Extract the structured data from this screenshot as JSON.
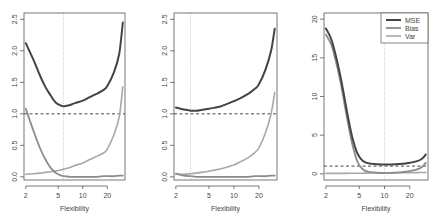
{
  "figure": {
    "width": 437,
    "height": 221,
    "colors": {
      "mse": "#444444",
      "bias": "#8c8c8c",
      "var": "#a8a8a8",
      "axis": "#555555",
      "ref": "#333333",
      "vline": "#bbbbbb"
    }
  },
  "chart_data": [
    {
      "type": "line",
      "title": "",
      "xlabel": "Flexibility",
      "ylabel": "",
      "xscale": "log",
      "xlim": [
        1.9,
        33
      ],
      "ylim": [
        -0.05,
        2.6
      ],
      "x_ticks": [
        2,
        5,
        10,
        20
      ],
      "x_tick_labels": [
        "2",
        "5",
        "10",
        "20"
      ],
      "y_ticks": [
        0.0,
        0.5,
        1.0,
        1.5,
        2.0,
        2.5
      ],
      "y_tick_labels": [
        "0.0",
        "0.5",
        "1.0",
        "1.5",
        "2.0",
        "2.5"
      ],
      "hline": {
        "y": 1.0,
        "style": "dashed"
      },
      "vline": {
        "x": 5.8,
        "style": "dotted"
      },
      "grid": false,
      "legend": null,
      "x": [
        2,
        2.5,
        3,
        3.5,
        4,
        4.5,
        5,
        5.8,
        7,
        8,
        10,
        12,
        15,
        18,
        20,
        24,
        28,
        31
      ],
      "series": [
        {
          "name": "MSE",
          "values": [
            2.12,
            1.85,
            1.6,
            1.42,
            1.3,
            1.2,
            1.15,
            1.12,
            1.14,
            1.17,
            1.21,
            1.26,
            1.32,
            1.38,
            1.44,
            1.65,
            1.95,
            2.45
          ]
        },
        {
          "name": "Bias",
          "values": [
            1.08,
            0.72,
            0.45,
            0.27,
            0.15,
            0.08,
            0.04,
            0.01,
            0.0,
            0.0,
            0.0,
            0.0,
            0.0,
            0.01,
            0.01,
            0.01,
            0.02,
            0.02
          ]
        },
        {
          "name": "Var",
          "values": [
            0.04,
            0.05,
            0.06,
            0.07,
            0.08,
            0.09,
            0.1,
            0.12,
            0.15,
            0.18,
            0.22,
            0.27,
            0.33,
            0.38,
            0.44,
            0.66,
            0.95,
            1.43
          ]
        }
      ]
    },
    {
      "type": "line",
      "title": "",
      "xlabel": "Flexibility",
      "ylabel": "",
      "xscale": "log",
      "xlim": [
        1.9,
        33
      ],
      "ylim": [
        -0.05,
        2.6
      ],
      "x_ticks": [
        2,
        5,
        10,
        20
      ],
      "x_tick_labels": [
        "2",
        "5",
        "10",
        "20"
      ],
      "y_ticks": [
        0.0,
        0.5,
        1.0,
        1.5,
        2.0,
        2.5
      ],
      "y_tick_labels": [
        "0.0",
        "0.5",
        "1.0",
        "1.5",
        "2.0",
        "2.5"
      ],
      "hline": {
        "y": 1.0,
        "style": "dashed"
      },
      "vline": {
        "x": 3.0,
        "style": "dotted"
      },
      "grid": false,
      "legend": null,
      "x": [
        2,
        2.5,
        3,
        3.5,
        4,
        5,
        6,
        7,
        8,
        10,
        12,
        15,
        18,
        20,
        24,
        28,
        31
      ],
      "series": [
        {
          "name": "MSE",
          "values": [
            1.1,
            1.07,
            1.05,
            1.05,
            1.06,
            1.08,
            1.1,
            1.12,
            1.15,
            1.2,
            1.25,
            1.32,
            1.4,
            1.47,
            1.7,
            2.0,
            2.35
          ]
        },
        {
          "name": "Bias",
          "values": [
            0.05,
            0.02,
            0.01,
            0.0,
            0.0,
            0.0,
            0.0,
            0.0,
            0.0,
            0.0,
            0.0,
            0.0,
            0.01,
            0.01,
            0.01,
            0.02,
            0.02
          ]
        },
        {
          "name": "Var",
          "values": [
            0.04,
            0.04,
            0.05,
            0.06,
            0.07,
            0.09,
            0.11,
            0.13,
            0.15,
            0.19,
            0.24,
            0.31,
            0.39,
            0.46,
            0.7,
            1.0,
            1.34
          ]
        }
      ]
    },
    {
      "type": "line",
      "title": "",
      "xlabel": "Flexibility",
      "ylabel": "",
      "xscale": "log",
      "xlim": [
        1.9,
        33
      ],
      "ylim": [
        -0.8,
        20.8
      ],
      "x_ticks": [
        2,
        5,
        10,
        20
      ],
      "x_tick_labels": [
        "2",
        "5",
        "10",
        "20"
      ],
      "y_ticks": [
        0,
        5,
        10,
        15,
        20
      ],
      "y_tick_labels": [
        "0",
        "5",
        "10",
        "15",
        "20"
      ],
      "hline": {
        "y": 1.0,
        "style": "dashed"
      },
      "vline": {
        "x": 10,
        "style": "dotted"
      },
      "grid": false,
      "legend": {
        "position": "topright",
        "entries": [
          "MSE",
          "Bias",
          "Var"
        ]
      },
      "x": [
        2,
        2.3,
        2.6,
        3,
        3.4,
        3.8,
        4.2,
        4.6,
        5,
        5.5,
        6,
        7,
        8,
        10,
        12,
        15,
        18,
        20,
        24,
        28,
        31
      ],
      "series": [
        {
          "name": "MSE",
          "values": [
            18.8,
            17.5,
            15.5,
            12.5,
            9.3,
            6.5,
            4.4,
            3.0,
            2.2,
            1.7,
            1.45,
            1.3,
            1.25,
            1.2,
            1.22,
            1.28,
            1.35,
            1.42,
            1.6,
            1.95,
            2.5
          ]
        },
        {
          "name": "Bias",
          "values": [
            18.0,
            16.8,
            14.8,
            11.8,
            8.5,
            5.7,
            3.5,
            2.0,
            1.1,
            0.6,
            0.35,
            0.2,
            0.15,
            0.1,
            0.12,
            0.18,
            0.27,
            0.35,
            0.55,
            0.9,
            1.4
          ]
        },
        {
          "name": "Var",
          "values": [
            0.05,
            0.05,
            0.05,
            0.06,
            0.06,
            0.07,
            0.07,
            0.08,
            0.08,
            0.08,
            0.09,
            0.1,
            0.1,
            0.11,
            0.12,
            0.13,
            0.14,
            0.15,
            0.16,
            0.17,
            0.18
          ]
        }
      ]
    }
  ]
}
